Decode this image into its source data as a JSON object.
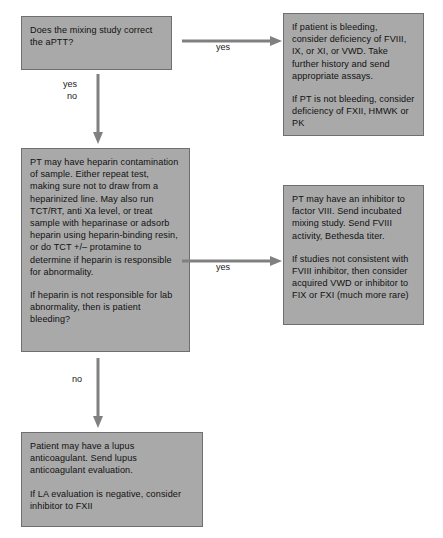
{
  "diagram": {
    "style": {
      "node_fill": "#a9a9a9",
      "node_border": "#6f6f6f",
      "arrow_color": "#808080",
      "text_color": "#111111",
      "background": "#ffffff"
    },
    "nodes": [
      {
        "id": "mixing-study",
        "name": "mixing-study-question",
        "paragraphs": [
          "Does the mixing study correct the aPTT?"
        ]
      },
      {
        "id": "bleeding-assay",
        "name": "factor-deficiency-outcome",
        "paragraphs": [
          "If patient is bleeding, consider deficiency of FVIII, IX, or XI, or VWD. Take further history and send appropriate assays.",
          "If PT is not bleeding, consider deficiency of FXII, HMWK or PK"
        ]
      },
      {
        "id": "heparin",
        "name": "heparin-contamination-step",
        "paragraphs": [
          "PT may have heparin contamination of sample. Either repeat test, making sure not to draw from a heparinized line. May also run TCT/RT, anti Xa level, or treat sample with heparinase or adsorb heparin using heparin-binding resin, or do TCT +/– protamine to determine if heparin is responsible for abnormality.",
          "If heparin is not responsible for lab abnormality, then is patient bleeding?"
        ]
      },
      {
        "id": "inhibitor",
        "name": "factor-viii-inhibitor-outcome",
        "paragraphs": [
          "PT may have an inhibitor to factor VIII. Send incubated mixing study. Send FVIII activity, Bethesda titer.",
          "If studies not consistent with FVIII inhibitor, then consider acquired VWD or inhibitor to FIX or FXI (much more rare)"
        ]
      },
      {
        "id": "lupus",
        "name": "lupus-anticoagulant-outcome",
        "paragraphs": [
          "Patient may have a lupus anticoagulant. Send lupus anticoagulant evaluation.",
          "If LA evaluation is negative, consider inhibitor to FXII"
        ]
      }
    ],
    "edges": [
      {
        "id": "yes-top",
        "name": "edge-mixing-study-to-factor-deficiency",
        "label": "yes",
        "direction": "right",
        "from": "mixing-study",
        "to": "bleeding-assay"
      },
      {
        "id": "yesno-down",
        "name": "edge-mixing-study-to-heparin",
        "label": "yes\nno",
        "direction": "down",
        "from": "mixing-study",
        "to": "heparin"
      },
      {
        "id": "yes-mid",
        "name": "edge-heparin-to-inhibitor",
        "label": "yes",
        "direction": "right",
        "from": "heparin",
        "to": "inhibitor"
      },
      {
        "id": "no-down",
        "name": "edge-heparin-to-lupus",
        "label": "no",
        "direction": "down",
        "from": "heparin",
        "to": "lupus"
      }
    ]
  }
}
